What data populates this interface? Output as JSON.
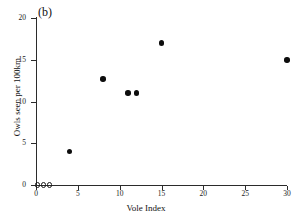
{
  "panel": {
    "label": "(b)"
  },
  "chart_data": {
    "type": "scatter",
    "title": "",
    "subtitle": "",
    "panel_label": "(b)",
    "xlabel": "Vole Index",
    "ylabel": "Owls seen per 100km",
    "xlim": [
      0,
      30
    ],
    "ylim": [
      0,
      20
    ],
    "xticks": [
      0,
      5,
      10,
      15,
      20,
      25,
      30
    ],
    "yticks": [
      0,
      5,
      10,
      15,
      20
    ],
    "xtick_labels": [
      "0",
      "5",
      "10",
      "15",
      "20",
      "25",
      "30"
    ],
    "ytick_labels": [
      "0",
      "5",
      "10",
      "15",
      "20"
    ],
    "grid": false,
    "legend": null,
    "marker_color": "#0d0d0d",
    "axis_color": "#2b2b2b",
    "background": "#ffffff",
    "series": [
      {
        "name": "observed",
        "marker": "filled-circle",
        "points": [
          {
            "x": 4,
            "y": 4
          },
          {
            "x": 8,
            "y": 12.7
          },
          {
            "x": 11,
            "y": 11
          },
          {
            "x": 12,
            "y": 11
          },
          {
            "x": 15,
            "y": 17
          },
          {
            "x": 30,
            "y": 15
          }
        ]
      },
      {
        "name": "zero-counts",
        "marker": "open-circle",
        "points": [
          {
            "x": 0.2,
            "y": 0
          },
          {
            "x": 0.9,
            "y": 0
          },
          {
            "x": 1.6,
            "y": 0
          }
        ]
      }
    ]
  }
}
